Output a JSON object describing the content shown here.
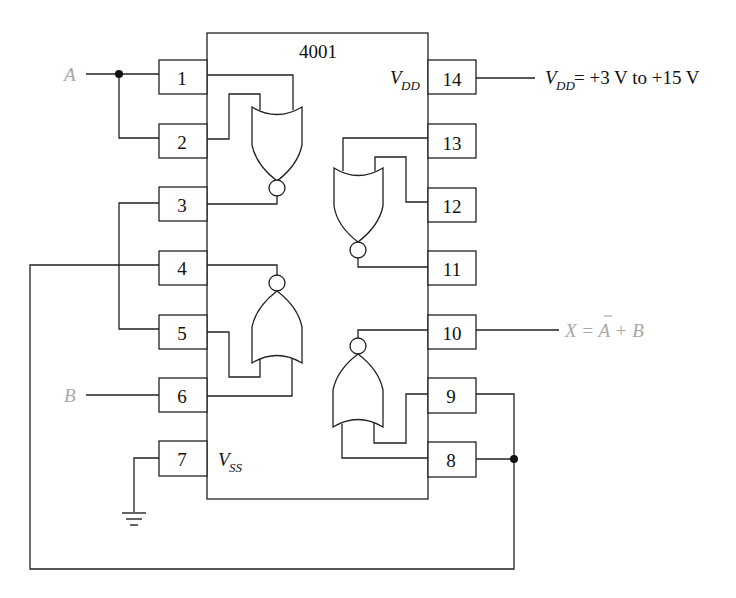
{
  "chip": {
    "part_number": "4001",
    "vdd_label": "V",
    "vdd_sub": "DD",
    "vss_label": "V",
    "vss_sub": "SS"
  },
  "pins": {
    "left": [
      {
        "number": "1"
      },
      {
        "number": "2"
      },
      {
        "number": "3"
      },
      {
        "number": "4"
      },
      {
        "number": "5"
      },
      {
        "number": "6"
      },
      {
        "number": "7"
      }
    ],
    "right": [
      {
        "number": "14"
      },
      {
        "number": "13"
      },
      {
        "number": "12"
      },
      {
        "number": "11"
      },
      {
        "number": "10"
      },
      {
        "number": "9"
      },
      {
        "number": "8"
      }
    ]
  },
  "signals": {
    "input_a": "A",
    "input_b": "B",
    "output_x_prefix": "X = ",
    "output_x_abar": "A",
    "output_x_suffix": " + B",
    "supply_v": "V",
    "supply_sub": "DD",
    "supply_range": " = +3 V to +15 V"
  },
  "colors": {
    "line": "#222222",
    "signal_label": "#a8a8a8",
    "text": "#111111"
  },
  "gates": [
    {
      "type": "NOR",
      "inputs": [
        "1",
        "2"
      ],
      "output": "3"
    },
    {
      "type": "NOR",
      "inputs": [
        "12",
        "13"
      ],
      "output": "11"
    },
    {
      "type": "NOR",
      "inputs": [
        "5",
        "6"
      ],
      "output": "4"
    },
    {
      "type": "NOR",
      "inputs": [
        "8",
        "9"
      ],
      "output": "10"
    }
  ]
}
